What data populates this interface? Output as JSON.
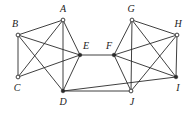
{
  "diagram": {
    "type": "graph",
    "nodes": [
      {
        "id": "A",
        "label": "A",
        "x": 63,
        "y": 20,
        "lx": 63,
        "ly": 12,
        "style": "hollow"
      },
      {
        "id": "B",
        "label": "B",
        "x": 18,
        "y": 35,
        "lx": 15,
        "ly": 27,
        "style": "hollow"
      },
      {
        "id": "C",
        "label": "C",
        "x": 18,
        "y": 77,
        "lx": 17,
        "ly": 91,
        "style": "hollow"
      },
      {
        "id": "D",
        "label": "D",
        "x": 63,
        "y": 91,
        "lx": 63,
        "ly": 105,
        "style": "filled"
      },
      {
        "id": "E",
        "label": "E",
        "x": 80,
        "y": 55,
        "lx": 86,
        "ly": 49,
        "style": "filled"
      },
      {
        "id": "F",
        "label": "F",
        "x": 114,
        "y": 55,
        "lx": 109,
        "ly": 49,
        "style": "filled"
      },
      {
        "id": "G",
        "label": "G",
        "x": 132,
        "y": 20,
        "lx": 131,
        "ly": 12,
        "style": "hollow"
      },
      {
        "id": "H",
        "label": "H",
        "x": 177,
        "y": 35,
        "lx": 178,
        "ly": 27,
        "style": "hollow"
      },
      {
        "id": "I",
        "label": "I",
        "x": 176,
        "y": 77,
        "lx": 178,
        "ly": 91,
        "style": "filled"
      },
      {
        "id": "J",
        "label": "J",
        "x": 131,
        "y": 91,
        "lx": 132,
        "ly": 105,
        "style": "hollow"
      }
    ],
    "edges": [
      [
        "A",
        "B"
      ],
      [
        "A",
        "C"
      ],
      [
        "A",
        "E"
      ],
      [
        "A",
        "D"
      ],
      [
        "B",
        "C"
      ],
      [
        "B",
        "E"
      ],
      [
        "B",
        "D"
      ],
      [
        "C",
        "E"
      ],
      [
        "E",
        "D"
      ],
      [
        "G",
        "H"
      ],
      [
        "G",
        "F"
      ],
      [
        "G",
        "J"
      ],
      [
        "G",
        "I"
      ],
      [
        "H",
        "F"
      ],
      [
        "H",
        "I"
      ],
      [
        "H",
        "J"
      ],
      [
        "F",
        "I"
      ],
      [
        "F",
        "J"
      ],
      [
        "E",
        "F"
      ],
      [
        "D",
        "J"
      ],
      [
        "D",
        "I"
      ]
    ]
  }
}
